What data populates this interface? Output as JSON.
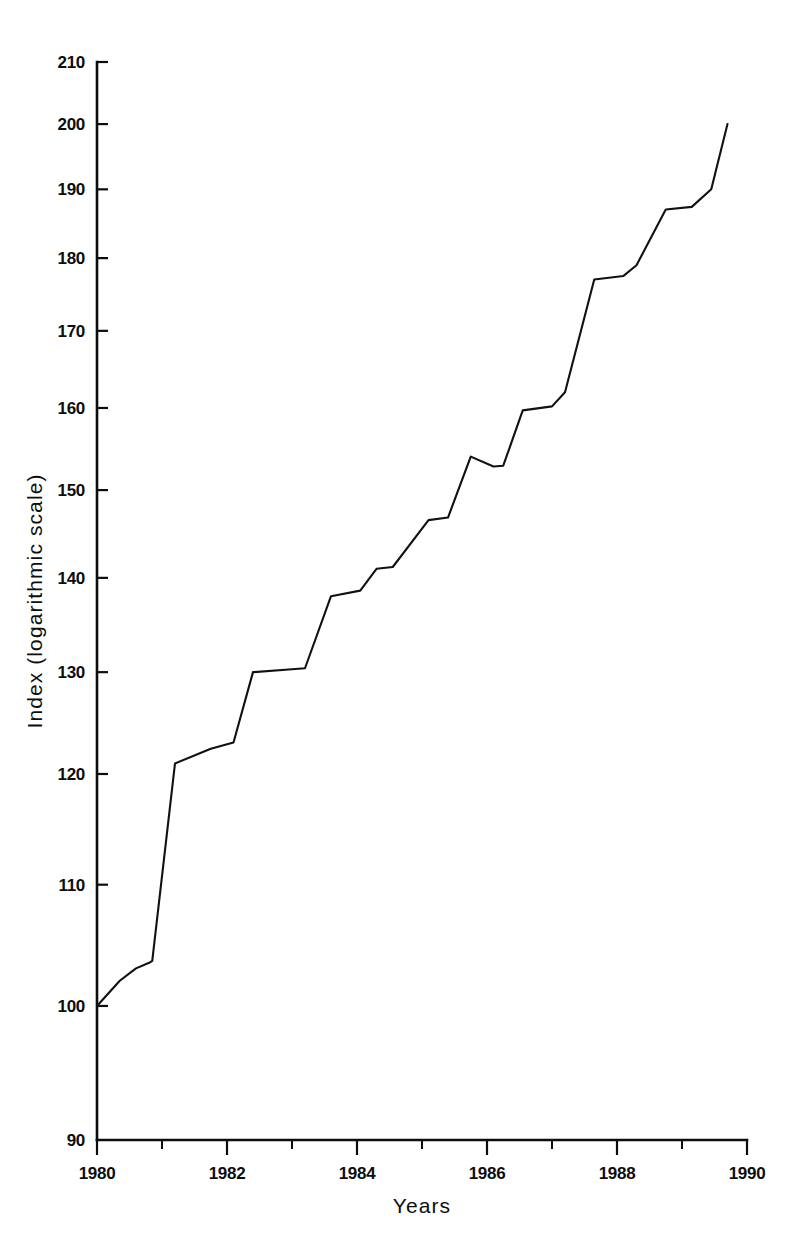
{
  "chart_data": {
    "type": "line",
    "title": "",
    "subtitle": "",
    "xlabel": "Years",
    "ylabel": "Index (logarithmic scale)",
    "yscale": "log",
    "xscale": "linear",
    "xlim": [
      1980,
      1990
    ],
    "ylim": [
      90,
      210
    ],
    "grid": false,
    "legend": false,
    "legend_position": "none",
    "x_tick_labels": [
      "1980",
      "1982",
      "1984",
      "1986",
      "1988",
      "1990"
    ],
    "x_tick_values": [
      1980,
      1982,
      1984,
      1986,
      1988,
      1990
    ],
    "x_minor_tick_values": [
      1981,
      1983,
      1985,
      1987,
      1989
    ],
    "y_tick_labels": [
      "90",
      "100",
      "110",
      "120",
      "130",
      "140",
      "150",
      "160",
      "170",
      "180",
      "190",
      "200",
      "210"
    ],
    "y_tick_values": [
      90,
      100,
      110,
      120,
      130,
      140,
      150,
      160,
      170,
      180,
      190,
      200,
      210
    ],
    "series": [
      {
        "name": "Index",
        "color": "#111111",
        "x": [
          1980.0,
          1980.35,
          1980.6,
          1980.82,
          1980.85,
          1981.2,
          1981.75,
          1982.1,
          1982.4,
          1983.0,
          1983.2,
          1983.6,
          1984.05,
          1984.3,
          1984.55,
          1985.1,
          1985.4,
          1985.75,
          1986.1,
          1986.25,
          1986.55,
          1987.0,
          1987.2,
          1987.65,
          1988.1,
          1988.3,
          1988.75,
          1989.15,
          1989.45,
          1989.7
        ],
        "y": [
          100.0,
          102.0,
          103.0,
          103.5,
          103.6,
          121.0,
          122.4,
          123.0,
          130.0,
          130.3,
          130.4,
          138.0,
          138.6,
          141.0,
          141.2,
          146.5,
          146.8,
          154.0,
          152.8,
          152.9,
          159.7,
          160.2,
          162.0,
          177.0,
          177.5,
          179.0,
          187.0,
          187.4,
          190.0,
          200.0
        ]
      }
    ]
  },
  "axes": {
    "y_axis_title": "Index (logarithmic scale)",
    "x_axis_title": "Years"
  }
}
